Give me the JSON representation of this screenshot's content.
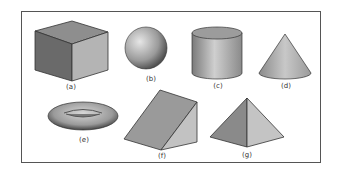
{
  "figure": {
    "shapes": [
      {
        "id": "a",
        "name": "cube",
        "label": "(a)"
      },
      {
        "id": "b",
        "name": "sphere",
        "label": "(b)"
      },
      {
        "id": "c",
        "name": "cylinder",
        "label": "(c)"
      },
      {
        "id": "d",
        "name": "cone",
        "label": "(d)"
      },
      {
        "id": "e",
        "name": "torus",
        "label": "(e)"
      },
      {
        "id": "f",
        "name": "wedge",
        "label": "(f)"
      },
      {
        "id": "g",
        "name": "pyramid",
        "label": "(g)"
      }
    ]
  }
}
